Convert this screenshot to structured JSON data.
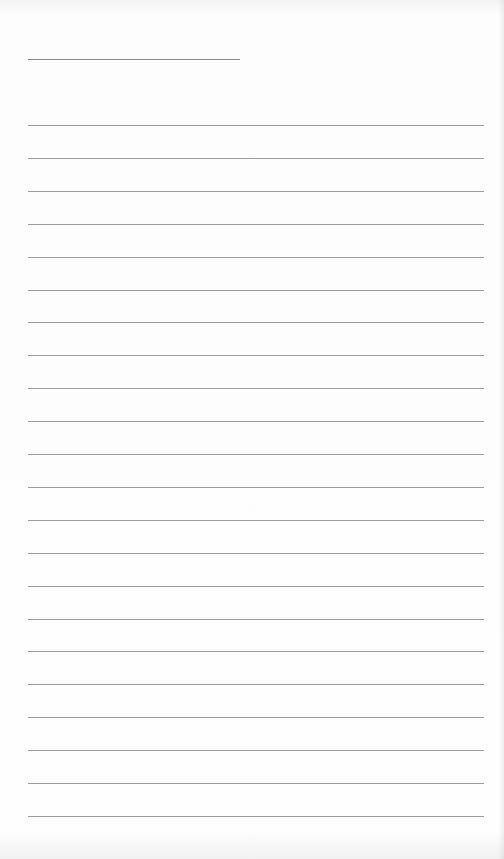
{
  "page": {
    "type": "lined-paper",
    "background_color": "#fdfdfd",
    "line_color": "#9d9d9d"
  },
  "header_line": {
    "present": true
  },
  "ruled_lines": {
    "count": 22,
    "first_top_px": 125,
    "spacing_px": 32.9
  }
}
